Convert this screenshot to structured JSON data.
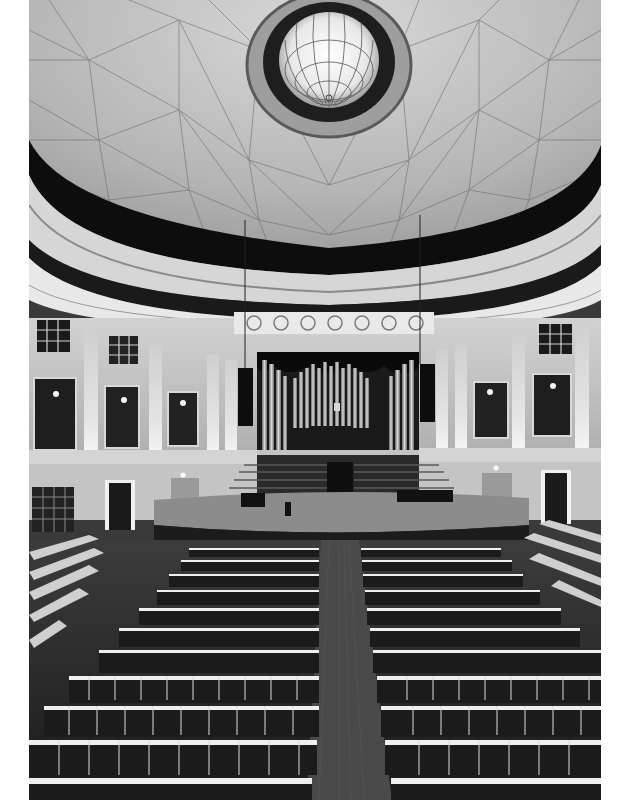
{
  "image": {
    "kind": "photograph",
    "subject": "Concert hall interior with domed ceiling and pipe organ",
    "color_mode": "grayscale",
    "frame": {
      "left": 29,
      "top": 0,
      "width": 572,
      "height": 800,
      "border_color": "#ffffff"
    },
    "regions": [
      {
        "name": "dome-ceiling",
        "description": "Geodesic-patterned dome with central stained-glass oculus"
      },
      {
        "name": "balcony-ring",
        "description": "Dark circular band and ornate cornice beneath the dome"
      },
      {
        "name": "upper-walls",
        "description": "Pilasters, lattice windows and dark wall panels with sconces"
      },
      {
        "name": "pipe-organ",
        "description": "Central organ with silver pipes behind tiered choir risers"
      },
      {
        "name": "stage",
        "description": "Curved wooden stage platform"
      },
      {
        "name": "seating",
        "description": "Rows of dark chairs split by a central aisle"
      }
    ],
    "palette": {
      "light": "#e6e6e6",
      "mid": "#9a9a9a",
      "dark": "#1c1c1c",
      "black": "#0a0a0a"
    }
  }
}
